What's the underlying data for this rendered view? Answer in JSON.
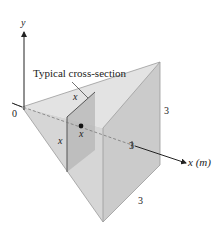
{
  "figure": {
    "type": "3d-solid-diagram"
  },
  "axes": {
    "y_label": "y",
    "x_label": "x (m)",
    "origin_label": "0"
  },
  "annotations": {
    "cross_section_label": "Typical cross-section",
    "cross_section_top_edge": "x",
    "cross_section_side_edge": "x",
    "cross_section_position": "x",
    "axis_tick_label": "3",
    "right_face_height": "3",
    "bottom_edge_length": "3"
  },
  "colors": {
    "solid_fill_light": "#e6e6e6",
    "solid_fill_mid": "#d4d4d4",
    "solid_fill_dark": "#c4c4c4",
    "cross_section_fill": "#b9b9b9",
    "edge": "#8a8a8a",
    "axis": "#222222"
  }
}
